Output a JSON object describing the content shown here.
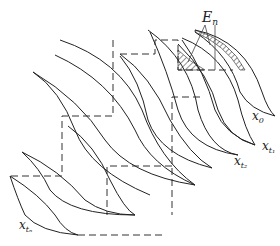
{
  "diagram": {
    "type": "staircase of successive fan-shaped curve families (iterated sets)",
    "labels": {
      "error_region": "E",
      "error_region_sub": "n",
      "x0": "x",
      "x0_sub": "0",
      "xt1": "x",
      "xt1_sub": "t₁",
      "xt2": "x",
      "xt2_sub": "t₂",
      "xtn": "x",
      "xtn_sub": "tₙ"
    },
    "colors": {
      "line": "#222222",
      "background": "#ffffff"
    }
  }
}
